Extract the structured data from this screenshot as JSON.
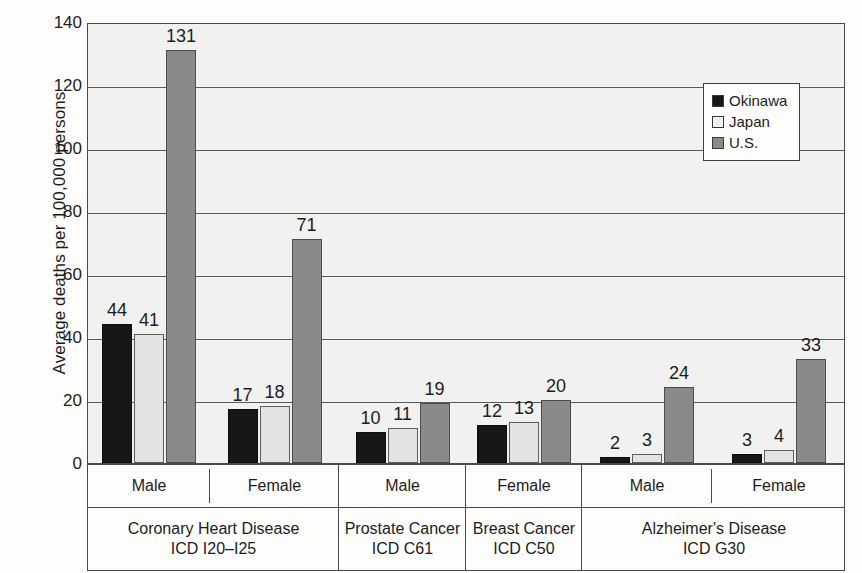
{
  "chart_data": {
    "type": "bar",
    "title": "",
    "xlabel": "",
    "ylabel": "Average deaths per 100,000 persons",
    "ylim": [
      0,
      140
    ],
    "ytick_step": 20,
    "yticks": [
      140,
      120,
      100,
      80,
      60,
      40,
      20,
      0
    ],
    "grid": true,
    "legend_position": "top-right",
    "series": [
      {
        "name": "Okinawa",
        "color": "#171717",
        "values": [
          44,
          17,
          10,
          12,
          2,
          3
        ]
      },
      {
        "name": "Japan",
        "color": "#e3e3e1",
        "values": [
          41,
          18,
          11,
          13,
          3,
          4
        ]
      },
      {
        "name": "U.S.",
        "color": "#8a8a8a",
        "values": [
          131,
          71,
          19,
          20,
          24,
          33
        ]
      }
    ],
    "categories": [
      "Male",
      "Female",
      "Male",
      "Female",
      "Male",
      "Female"
    ],
    "groups": [
      {
        "disease": "Coronary Heart Disease",
        "icd": "ICD I20–I25",
        "sexes": [
          "Male",
          "Female"
        ]
      },
      {
        "disease": "Prostate Cancer",
        "icd": "ICD C61",
        "sexes": [
          "Male"
        ]
      },
      {
        "disease": "Breast Cancer",
        "icd": "ICD C50",
        "sexes": [
          "Female"
        ]
      },
      {
        "disease": "Alzheimer's Disease",
        "icd": "ICD G30",
        "sexes": [
          "Male",
          "Female"
        ]
      }
    ]
  },
  "axis": {
    "y_title": "Average deaths per 100,000 persons",
    "y_ticks": [
      "140",
      "120",
      "100",
      "80",
      "60",
      "40",
      "20",
      "0"
    ]
  },
  "legend": {
    "items": [
      {
        "label": "Okinawa",
        "swatch": "okinawa"
      },
      {
        "label": "Japan",
        "swatch": "japan"
      },
      {
        "label": "U.S.",
        "swatch": "us"
      }
    ]
  },
  "sex_cells": [
    {
      "label": "Male"
    },
    {
      "label": "Female"
    },
    {
      "label": "Male"
    },
    {
      "label": "Female"
    },
    {
      "label": "Male"
    },
    {
      "label": "Female"
    }
  ],
  "disease_cells": [
    {
      "name": "Coronary Heart Disease",
      "icd": "ICD I20–I25"
    },
    {
      "name": "Prostate Cancer",
      "icd": "ICD C61"
    },
    {
      "name": "Breast Cancer",
      "icd": "ICD C50"
    },
    {
      "name": "Alzheimer's Disease",
      "icd": "ICD G30"
    }
  ],
  "bar_values": [
    {
      "group": 0,
      "okinawa": "44",
      "japan": "41",
      "us": "131"
    },
    {
      "group": 1,
      "okinawa": "17",
      "japan": "18",
      "us": "71"
    },
    {
      "group": 2,
      "okinawa": "10",
      "japan": "11",
      "us": "19"
    },
    {
      "group": 3,
      "okinawa": "12",
      "japan": "13",
      "us": "20"
    },
    {
      "group": 4,
      "okinawa": "2",
      "japan": "3",
      "us": "24"
    },
    {
      "group": 5,
      "okinawa": "3",
      "japan": "4",
      "us": "33"
    }
  ]
}
